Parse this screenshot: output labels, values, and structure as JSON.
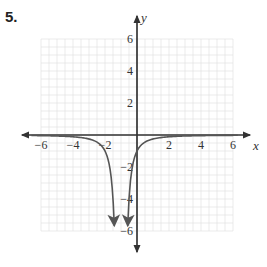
{
  "problem_number": "5.",
  "chart_data": {
    "type": "line",
    "title": "",
    "function": "y = -1/(x+1)^2",
    "xlabel": "x",
    "ylabel": "y",
    "xlim": [
      -6,
      6
    ],
    "ylim": [
      -6,
      6
    ],
    "grid": true,
    "x_ticks": [
      -6,
      -4,
      -2,
      2,
      4,
      6
    ],
    "y_ticks": [
      6,
      4,
      2,
      -2,
      -4,
      -6
    ],
    "x_tick_labels": [
      "−6",
      "−4",
      "−2",
      "2",
      "4",
      "6"
    ],
    "y_tick_labels": [
      "6",
      "4",
      "2",
      "−2",
      "−4",
      "−6"
    ],
    "vertical_asymptote": -1,
    "horizontal_asymptote": 0,
    "series": [
      {
        "name": "left branch",
        "x": [
          -6.5,
          -5,
          -4,
          -3,
          -2.5,
          -2,
          -1.7,
          -1.5,
          -1.41
        ],
        "y": [
          -0.03,
          -0.06,
          -0.11,
          -0.25,
          -0.44,
          -1.0,
          -2.04,
          -4.0,
          -5.9
        ]
      },
      {
        "name": "right branch",
        "x": [
          -0.59,
          -0.5,
          -0.3,
          0,
          0.5,
          1,
          2,
          3,
          4,
          5,
          6.5
        ],
        "y": [
          -5.9,
          -4.0,
          -2.04,
          -1.0,
          -0.44,
          -0.25,
          -0.11,
          -0.06,
          -0.04,
          -0.03,
          -0.02
        ]
      }
    ],
    "curve_color": "#555555",
    "axis_color": "#333333",
    "grid_color": "#dddddd"
  }
}
